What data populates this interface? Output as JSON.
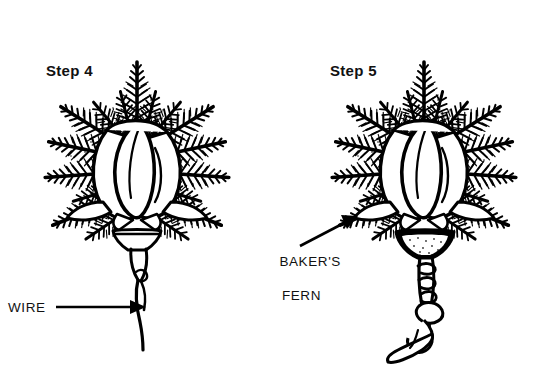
{
  "figure": {
    "title_step4": "Step 4",
    "title_step5": "Step 5",
    "background_color": "#ffffff",
    "ink_color": "#000000",
    "medium": "black-and-white line art illustration"
  },
  "labels": {
    "step4": "Step 4",
    "step5": "Step 5",
    "wire": "WIRE",
    "bakers_fern_line1": "BAKER'S",
    "bakers_fern_line2": "FERN"
  },
  "callouts": [
    {
      "name": "wire-callout",
      "text": "WIRE",
      "arrow_direction": "right",
      "points_to": "bare wire stem below rosebud in Step 4"
    },
    {
      "name": "bakers-fern-callout",
      "text": "BAKER'S FERN",
      "arrow_direction": "up-right",
      "points_to": "fern collar at base of rosebud in Step 5"
    }
  ],
  "panels": [
    {
      "name": "step-4-panel",
      "label": "Step 4",
      "description": "Rosebud backed by baker's fern fronds with a bare wire stem extending straight down."
    },
    {
      "name": "step-5-panel",
      "label": "Step 5",
      "description": "Same rosebud and fern with the wire stem wrapped in floral tape/ribbon that spirals down and ends in a curled tail."
    }
  ]
}
